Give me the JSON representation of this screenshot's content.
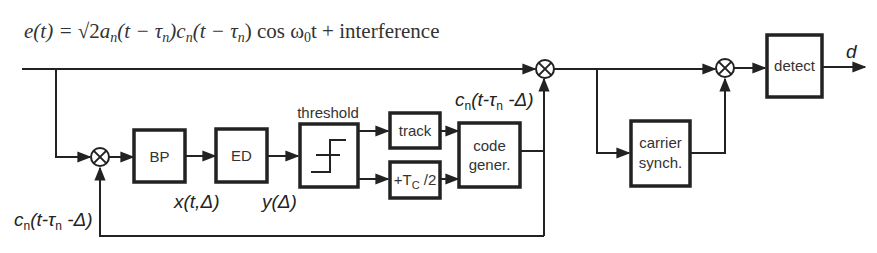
{
  "equation": {
    "lhs": "e(t) = ",
    "sqrt": "√2",
    "rhs_terms": [
      "a",
      "n",
      "(t − τ",
      "n",
      ")c",
      "n",
      "(t − τ",
      "n",
      ") cos ω",
      "0",
      "t + interference"
    ],
    "full_text": "e(t) = √2 a_n(t − τ_n) c_n(t − τ_n) cos ω_0 t + interference"
  },
  "blocks": {
    "bp": "BP",
    "ed": "ED",
    "threshold_title": "threshold",
    "track": "track",
    "half_chip": {
      "plus": "+T",
      "sub": "C",
      "tail": " /2"
    },
    "code_gen_line1": "code",
    "code_gen_line2": "gener.",
    "carrier_line1": "carrier",
    "carrier_line2": "synch.",
    "detect": "detect"
  },
  "signals": {
    "local_code_left": {
      "c": "c",
      "n": "n",
      "rest1": "(t-τ",
      "n2": "n",
      "rest2": " -Δ)"
    },
    "local_code_top": {
      "c": "c",
      "n": "n",
      "rest1": "(t-τ",
      "n2": "n",
      "rest2": " -Δ)"
    },
    "x_signal": "x(t,Δ)",
    "y_signal": "y(Δ)",
    "output": "d"
  }
}
